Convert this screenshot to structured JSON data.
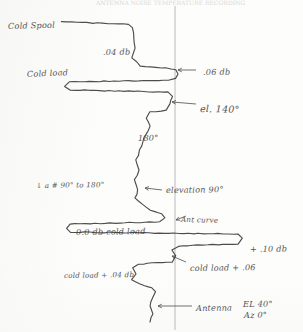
{
  "document": {
    "kind": "hand-drawn chart-recorder strip",
    "header_cutoff_text": "ANTENNA  NOISE  TEMPERATURE  RECORDING"
  },
  "axis": {
    "reference_line_label": "vertical reference baseline"
  },
  "annotations": [
    {
      "id": "cold-spool",
      "text": "Cold Spool",
      "x": 8,
      "y": 22,
      "size": "",
      "tilt": "t1"
    },
    {
      "id": "level-04db",
      "text": ".04 db",
      "x": 103,
      "y": 48,
      "size": "",
      "tilt": "t3"
    },
    {
      "id": "cold-load-upper",
      "text": "Cold load",
      "x": 27,
      "y": 70,
      "size": "",
      "tilt": "t2"
    },
    {
      "id": "level-06db",
      "text": ".06 db",
      "x": 203,
      "y": 68,
      "size": "",
      "tilt": "t3"
    },
    {
      "id": "el-140",
      "text": "el. 140°",
      "x": 200,
      "y": 104,
      "size": "lg",
      "tilt": "t4"
    },
    {
      "id": "angle-180",
      "text": "180°",
      "x": 138,
      "y": 134,
      "size": "",
      "tilt": "t3"
    },
    {
      "id": "sweep-note",
      "text": "↓ a # 90° to 180°",
      "x": 36,
      "y": 182,
      "size": "sm",
      "tilt": "t3"
    },
    {
      "id": "elevation-90",
      "text": "elevation 90°",
      "x": 166,
      "y": 186,
      "size": "",
      "tilt": "t3"
    },
    {
      "id": "zero-db-cold-load",
      "text": "0.0 db cold load",
      "x": 76,
      "y": 228,
      "size": "",
      "tilt": "t3"
    },
    {
      "id": "ant-curve",
      "text": "Ant curve",
      "x": 181,
      "y": 216,
      "size": "sm",
      "tilt": "t4"
    },
    {
      "id": "level-10db",
      "text": "+ .10 db",
      "x": 250,
      "y": 245,
      "size": "",
      "tilt": "t3"
    },
    {
      "id": "cold-load-06",
      "text": "cold load + .06",
      "x": 190,
      "y": 264,
      "size": "",
      "tilt": "t3"
    },
    {
      "id": "cold-load-04db",
      "text": "cold load + .04 db",
      "x": 64,
      "y": 272,
      "size": "sm",
      "tilt": "t3"
    },
    {
      "id": "antenna-pointing",
      "text": "Antenna",
      "x": 196,
      "y": 304,
      "size": "",
      "tilt": "t3"
    },
    {
      "id": "antenna-el",
      "text": "EL  40°",
      "x": 243,
      "y": 300,
      "size": "",
      "tilt": "t3"
    },
    {
      "id": "antenna-az",
      "text": "Az   0°",
      "x": 244,
      "y": 311,
      "size": "",
      "tilt": "t3"
    }
  ],
  "chart_data": {
    "type": "line",
    "xlabel": "deflection (db)",
    "ylabel": "time / elevation sweep",
    "orientation": "vertical strip chart, time increases downward, signal deflects horizontally",
    "grid": false,
    "legend": null,
    "reference_line_x": 175,
    "xlim": [
      0,
      303
    ],
    "ylim": [
      0,
      332
    ],
    "levels": [
      {
        "label": "Cold Spool",
        "value_db": null,
        "x_px": 62
      },
      {
        "label": ".04 db",
        "value_db": 0.04,
        "x_px": 137
      },
      {
        "label": ".06 db",
        "value_db": 0.06,
        "x_px": 178
      },
      {
        "label": "0.0 db cold load",
        "value_db": 0.0,
        "x_px": 70
      },
      {
        "label": "+ .10 db",
        "value_db": 0.1,
        "x_px": 238
      },
      {
        "label": "cold load + .06",
        "value_db": 0.06,
        "x_px": 172
      },
      {
        "label": "cold load + .04 db",
        "value_db": 0.04,
        "x_px": 135
      }
    ],
    "events": [
      {
        "label": "el. 140°",
        "y_px": 104
      },
      {
        "label": "180°",
        "y_px": 134
      },
      {
        "label": "elevation 90°",
        "y_px": 190
      },
      {
        "label": "Ant curve",
        "y_px": 216
      },
      {
        "label": "Antenna EL 40° Az 0°",
        "y_px": 306
      }
    ],
    "trace_points": [
      [
        62,
        22
      ],
      [
        128,
        24
      ],
      [
        133,
        28
      ],
      [
        135,
        48
      ],
      [
        132,
        58
      ],
      [
        137,
        62
      ],
      [
        140,
        66
      ],
      [
        166,
        68
      ],
      [
        176,
        70
      ],
      [
        178,
        74
      ],
      [
        175,
        78
      ],
      [
        168,
        80
      ],
      [
        70,
        82
      ],
      [
        64,
        86
      ],
      [
        70,
        90
      ],
      [
        168,
        92
      ],
      [
        172,
        96
      ],
      [
        170,
        104
      ],
      [
        166,
        110
      ],
      [
        150,
        112
      ],
      [
        146,
        118
      ],
      [
        150,
        126
      ],
      [
        146,
        134
      ],
      [
        143,
        142
      ],
      [
        140,
        150
      ],
      [
        136,
        160
      ],
      [
        139,
        170
      ],
      [
        135,
        180
      ],
      [
        138,
        190
      ],
      [
        135,
        198
      ],
      [
        142,
        204
      ],
      [
        150,
        210
      ],
      [
        162,
        214
      ],
      [
        165,
        218
      ],
      [
        160,
        222
      ],
      [
        70,
        224
      ],
      [
        66,
        228
      ],
      [
        70,
        232
      ],
      [
        238,
        234
      ],
      [
        242,
        238
      ],
      [
        238,
        244
      ],
      [
        178,
        246
      ],
      [
        172,
        250
      ],
      [
        176,
        256
      ],
      [
        172,
        262
      ],
      [
        138,
        264
      ],
      [
        133,
        268
      ],
      [
        136,
        274
      ],
      [
        132,
        280
      ],
      [
        140,
        284
      ],
      [
        152,
        288
      ],
      [
        156,
        292
      ],
      [
        152,
        298
      ],
      [
        150,
        306
      ],
      [
        153,
        314
      ],
      [
        150,
        322
      ]
    ],
    "callout_arrows": [
      {
        "from": [
          196,
          70
        ],
        "to": [
          178,
          70
        ],
        "target": ".06 db"
      },
      {
        "from": [
          196,
          104
        ],
        "to": [
          172,
          102
        ],
        "target": "el. 140°"
      },
      {
        "from": [
          162,
          190
        ],
        "to": [
          145,
          188
        ],
        "target": "elevation 90°"
      },
      {
        "from": [
          186,
          216
        ],
        "to": [
          176,
          220
        ],
        "target": "Ant curve"
      },
      {
        "from": [
          186,
          262
        ],
        "to": [
          172,
          256
        ],
        "target": "cold load + .06"
      },
      {
        "from": [
          192,
          306
        ],
        "to": [
          158,
          306
        ],
        "target": "Antenna"
      }
    ]
  }
}
